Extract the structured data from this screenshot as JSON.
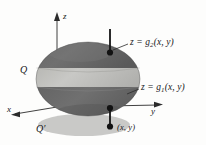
{
  "figure": {
    "type": "3d-solid-diagram",
    "axes": {
      "z_label": "z",
      "y_label": "y",
      "x_label": "x"
    },
    "labels": {
      "solid": "Q",
      "projection": "Q′",
      "point": "(x, y)",
      "upper_surface_prefix": "z = g",
      "upper_surface_sub": "2",
      "upper_surface_args": "(x, y)",
      "lower_surface_prefix": "z = g",
      "lower_surface_sub": "1",
      "lower_surface_args": "(x, y)",
      "upper_surface_full": "z = g2(x, y)",
      "lower_surface_full": "z = g1(x, y)"
    },
    "colors": {
      "solid_dark": "#6d6d6d",
      "solid_band": "#c0c0bd",
      "solid_shade": "#585858",
      "shadow": "#c6c6c4",
      "axis": "#2b2b2b",
      "text": "#17171a",
      "background": "#fdfdfc"
    },
    "markers": {
      "top_point": "filled-dot",
      "bottom_point": "filled-dot",
      "projection_point": "filled-dot"
    }
  }
}
